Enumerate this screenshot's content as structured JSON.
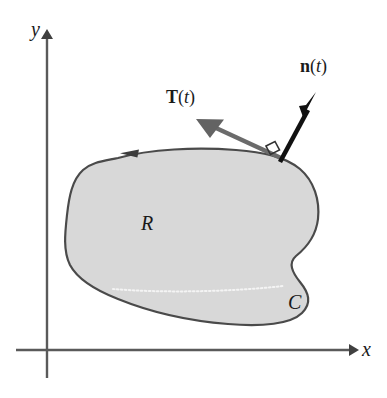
{
  "figure": {
    "background_color": "#ffffff",
    "axes": {
      "x_label": "x",
      "y_label": "y",
      "axis_color": "#404040",
      "origin_px": [
        47,
        350
      ]
    },
    "region": {
      "label": "R",
      "fill_color": "#d8d8d8",
      "outline_color": "#4a4a4a",
      "inner_dotted_color": "#f2f2f2"
    },
    "curve": {
      "label": "C",
      "orientation": "counterclockwise",
      "orientation_arrow": "left-pointing-arrowhead"
    },
    "vectors": [
      {
        "id": "tangent",
        "name": "T",
        "argument": "(t)",
        "label_text": "T(t)",
        "color": "#6b6b6b",
        "description": "unit tangent vector"
      },
      {
        "id": "normal",
        "name": "n",
        "argument": "(t)",
        "label_text": "n(t)",
        "color": "#111111",
        "description": "outward unit normal vector"
      }
    ],
    "right_angle_marker": {
      "present": true,
      "color": "#333333"
    }
  }
}
